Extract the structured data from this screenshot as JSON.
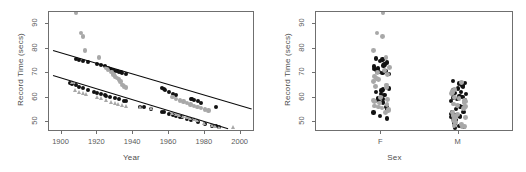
{
  "figure": {
    "background": "#ffffff",
    "panels": [
      {
        "id": "scatter-year",
        "xlabel": "Year",
        "ylabel": "Record Time (secs)",
        "xticks": [
          "1900",
          "1920",
          "1940",
          "1960",
          "1980",
          "2000"
        ],
        "yticks": [
          "50",
          "60",
          "70",
          "80",
          "90"
        ]
      },
      {
        "id": "strip-sex",
        "xlabel": "Sex",
        "ylabel": "Record Time (secs)",
        "xticks": [
          "F",
          "M"
        ],
        "yticks": [
          "50",
          "60",
          "70",
          "80",
          "90"
        ]
      }
    ]
  },
  "colors": {
    "dark_points": "#121212",
    "gray_points": "#a8a8a8",
    "line": "#0a0a0a",
    "axis": "#6f6f6f",
    "text": "#4d4d4d"
  },
  "chart_data": [
    {
      "type": "scatter",
      "title": "",
      "xlabel": "Year",
      "ylabel": "Record Time (secs)",
      "xlim": [
        1893,
        2008
      ],
      "ylim": [
        46,
        95
      ],
      "xticks": [
        1900,
        1920,
        1940,
        1960,
        1980,
        2000
      ],
      "yticks": [
        50,
        60,
        70,
        80,
        90
      ],
      "grid": false,
      "legend": null,
      "series": [
        {
          "name": "Female records (upper, dark)",
          "marker": "filled-circle",
          "color": "#121212",
          "x": [
            1908,
            1910,
            1912,
            1915,
            1920,
            1922,
            1924,
            1926,
            1927,
            1928,
            1929,
            1930,
            1931,
            1932,
            1933,
            1934,
            1936,
            1956,
            1957,
            1958,
            1960,
            1962,
            1964,
            1972,
            1973,
            1974,
            1976,
            1978,
            1986
          ],
          "y": [
            76.0,
            75.6,
            75.0,
            74.4,
            73.6,
            73.2,
            72.8,
            72.0,
            71.6,
            71.4,
            71.2,
            71.0,
            70.8,
            70.6,
            70.4,
            70.2,
            69.8,
            63.8,
            63.4,
            63.0,
            62.4,
            61.6,
            61.0,
            59.6,
            59.4,
            59.2,
            58.6,
            58.0,
            56.2
          ]
        },
        {
          "name": "Female records (gray jitter, upper)",
          "marker": "circle",
          "color": "#a8a8a8",
          "x": [
            1908,
            1911,
            1912,
            1913,
            1921,
            1925,
            1926,
            1928,
            1929,
            1930,
            1931,
            1932,
            1933,
            1934,
            1935,
            1936,
            1962,
            1964,
            1966,
            1968,
            1970,
            1972,
            1974,
            1976,
            1978,
            1980,
            1982
          ],
          "y": [
            94.6,
            86.4,
            85.0,
            79.2,
            76.4,
            72.2,
            71.2,
            70.4,
            69.4,
            68.6,
            68.0,
            67.4,
            66.6,
            65.2,
            64.6,
            64.2,
            60.2,
            59.4,
            58.8,
            58.4,
            57.8,
            57.2,
            56.6,
            56.2,
            55.8,
            55.2,
            54.8
          ]
        },
        {
          "name": "Male records (lower, dark)",
          "marker": "filled-circle",
          "color": "#121212",
          "x": [
            1905,
            1906,
            1908,
            1910,
            1912,
            1915,
            1918,
            1920,
            1922,
            1924,
            1925,
            1927,
            1930,
            1932,
            1935,
            1936,
            1944,
            1946,
            1950,
            1956,
            1957,
            1960,
            1962,
            1964,
            1966,
            1967,
            1970,
            1972,
            1976,
            1980,
            1984,
            1986,
            1988
          ],
          "y": [
            66.0,
            65.8,
            65.0,
            64.4,
            63.8,
            63.2,
            62.4,
            61.8,
            61.4,
            61.0,
            60.8,
            60.4,
            59.8,
            59.4,
            58.8,
            58.6,
            56.4,
            56.2,
            55.4,
            54.2,
            54.0,
            53.4,
            53.0,
            52.6,
            52.2,
            52.0,
            51.4,
            51.0,
            50.2,
            49.4,
            48.6,
            48.4,
            48.0
          ]
        },
        {
          "name": "Male records (gray jitter, lower)",
          "marker": "triangle",
          "color": "#a8a8a8",
          "x": [
            1906,
            1908,
            1910,
            1912,
            1914,
            1920,
            1922,
            1925,
            1928,
            1930,
            1932,
            1934,
            1936,
            1944,
            1950,
            1962,
            1964,
            1966,
            1968,
            1970,
            1972,
            1974,
            1976,
            1980,
            1984,
            1986,
            1988,
            1996
          ],
          "y": [
            66.2,
            63.2,
            62.4,
            62.0,
            61.6,
            60.2,
            59.8,
            59.0,
            58.4,
            58.0,
            57.4,
            56.8,
            56.4,
            56.0,
            55.6,
            53.8,
            53.2,
            52.8,
            52.4,
            52.0,
            51.6,
            51.2,
            50.8,
            49.8,
            49.0,
            48.6,
            48.2,
            48.0
          ]
        }
      ],
      "fit_lines": [
        {
          "name": "upper regression",
          "x1": 1895,
          "y1": 79.3,
          "x2": 2006,
          "y2": 55.4
        },
        {
          "name": "lower regression",
          "x1": 1895,
          "y1": 69.4,
          "x2": 1993,
          "y2": 47.6
        }
      ]
    },
    {
      "type": "scatter",
      "title": "",
      "xlabel": "Sex",
      "ylabel": "Record Time (secs)",
      "categories": [
        "F",
        "M"
      ],
      "ylim": [
        46,
        95
      ],
      "yticks": [
        50,
        60,
        70,
        80,
        90
      ],
      "grid": false,
      "legend": null,
      "series": [
        {
          "name": "F — dark",
          "group": "F",
          "marker": "filled-circle",
          "color": "#121212",
          "values": [
            76.0,
            75.6,
            75.0,
            74.4,
            73.6,
            73.2,
            72.8,
            72.0,
            71.6,
            71.4,
            71.2,
            71.0,
            70.8,
            70.6,
            70.4,
            70.2,
            69.8,
            63.8,
            63.4,
            63.0,
            62.4,
            61.6,
            61.0,
            59.6,
            59.4,
            59.2,
            58.6,
            58.0,
            56.2,
            55.0,
            54.0,
            52.5,
            51.5
          ]
        },
        {
          "name": "F — gray",
          "group": "F",
          "marker": "circle",
          "color": "#a8a8a8",
          "values": [
            94.6,
            86.4,
            85.0,
            79.2,
            76.4,
            72.2,
            71.2,
            70.4,
            69.4,
            68.6,
            68.0,
            67.4,
            66.6,
            65.2,
            64.6,
            64.2,
            60.2,
            59.4,
            58.8,
            58.4,
            57.8,
            57.2,
            56.6,
            56.2,
            55.8,
            55.2,
            54.8,
            53.8
          ]
        },
        {
          "name": "M — dark",
          "group": "M",
          "marker": "filled-circle",
          "color": "#121212",
          "values": [
            66.8,
            66.0,
            65.8,
            65.0,
            64.4,
            63.8,
            63.2,
            62.4,
            61.8,
            61.4,
            61.0,
            60.8,
            60.4,
            59.8,
            59.4,
            58.8,
            58.6,
            56.4,
            56.2,
            55.4,
            54.2,
            54.0,
            53.4,
            53.0,
            52.6,
            52.2,
            52.0,
            51.4,
            51.0,
            50.2,
            49.4,
            48.6,
            48.4,
            48.0,
            47.6
          ]
        },
        {
          "name": "M — gray",
          "group": "M",
          "marker": "circle",
          "color": "#a8a8a8",
          "values": [
            66.2,
            63.2,
            62.4,
            62.0,
            61.6,
            60.2,
            59.8,
            59.0,
            58.4,
            58.0,
            57.4,
            56.8,
            56.4,
            56.0,
            55.6,
            53.8,
            53.2,
            52.8,
            52.4,
            52.0,
            51.6,
            51.2,
            50.8,
            49.8,
            49.0,
            48.6,
            48.2,
            48.0
          ]
        }
      ]
    }
  ]
}
